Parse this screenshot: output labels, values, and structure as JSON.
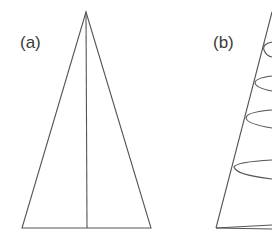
{
  "panels": [
    {
      "label": "(a)",
      "description": "isosceles triangle with vertical center axis"
    },
    {
      "label": "(b)",
      "description": "cone outline with helical winding curves"
    }
  ],
  "colors": {
    "stroke": "#555555",
    "background": "#ffffff",
    "label": "#3a3a3a"
  }
}
